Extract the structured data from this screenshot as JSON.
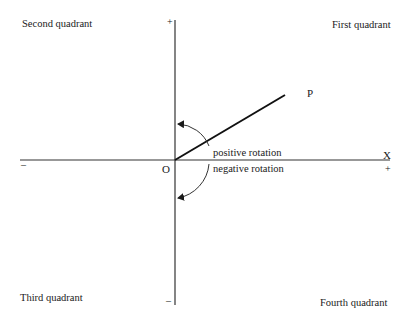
{
  "diagram": {
    "quadrants": {
      "first": "First quadrant",
      "second": "Second quadrant",
      "third": "Third quadrant",
      "fourth": "Fourth quadrant"
    },
    "axes": {
      "x_label": "X",
      "x_positive": "+",
      "x_negative": "–",
      "y_positive": "+",
      "y_negative": "–",
      "origin": "O"
    },
    "point": "P",
    "rotation": {
      "positive": "positive rotation",
      "negative": "negative rotation"
    }
  }
}
